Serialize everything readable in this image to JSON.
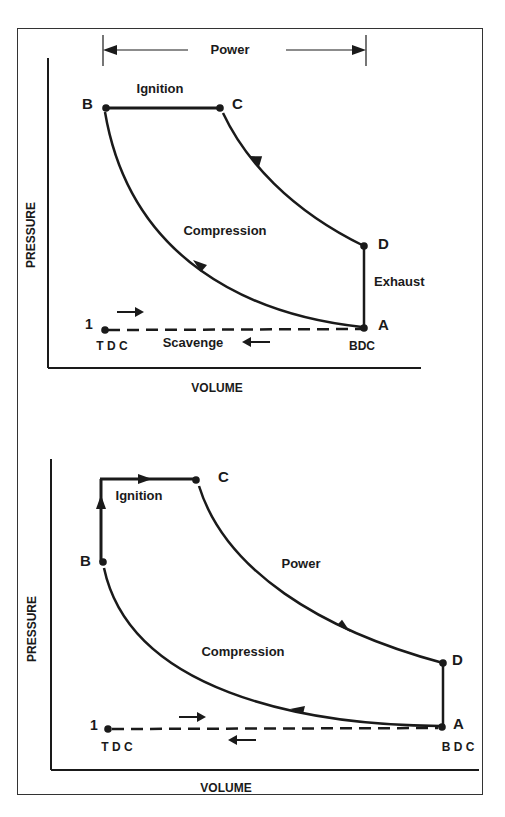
{
  "colors": {
    "ink": "#1a1a1a",
    "frame": "#333333",
    "background": "#ffffff"
  },
  "diagrams": [
    {
      "id": "top",
      "description": "Pressure-volume diagram, constant-pressure ignition cycle",
      "axis_x": "VOLUME",
      "axis_y": "PRESSURE",
      "dimension_label": "Power",
      "points": {
        "B": "B",
        "C": "C",
        "D": "D",
        "A": "A",
        "one": "1"
      },
      "labels": {
        "ignition": "Ignition",
        "compression": "Compression",
        "exhaust": "Exhaust",
        "scavenge": "Scavenge",
        "tdc": "T D C",
        "bdc": "BDC"
      }
    },
    {
      "id": "bottom",
      "description": "Pressure-volume diagram, combined constant-volume and constant-pressure ignition cycle",
      "axis_x": "VOLUME",
      "axis_y": "PRESSURE",
      "points": {
        "B": "B",
        "C": "C",
        "D": "D",
        "A": "A",
        "one": "1"
      },
      "labels": {
        "ignition": "Ignition",
        "power": "Power",
        "compression": "Compression",
        "tdc": "T D C",
        "bdc": "B D C"
      }
    }
  ]
}
